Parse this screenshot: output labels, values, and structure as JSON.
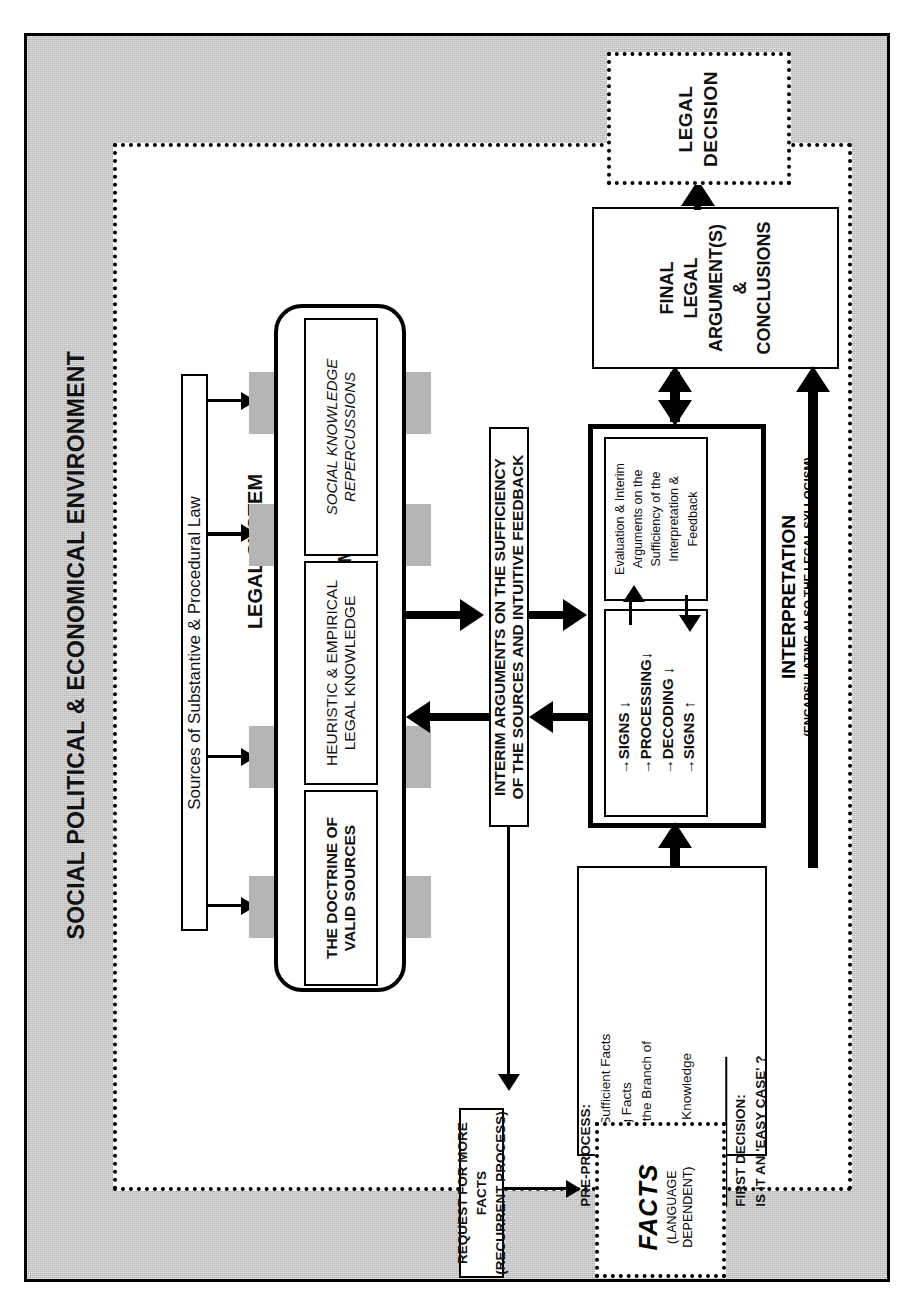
{
  "environment": {
    "title": "SOCIAL POLITICAL & ECONOMICAL ENVIRONMENT",
    "fill_color": "#c9c9c9"
  },
  "legal_system": {
    "label": "LEGAL SYSTEM"
  },
  "sources_box": {
    "label": "Sources of Substantive & Procedural Law"
  },
  "subsystem": {
    "label": "LEGAL SUBSYSTEM",
    "items": [
      {
        "label": "THE DOCTRINE OF\nVALID SOURCES"
      },
      {
        "label": "HEURISTIC & EMPIRICAL\nLEGAL KNOWLEDGE"
      },
      {
        "label": "SOCIAL KNOWLEDGE\nREPERCUSSIONS"
      }
    ],
    "tab_color": "#b5b5b5"
  },
  "interim_box": {
    "label": "INTERIM ARGUMENTS ON THE SUFFICIENCY\nOF THE SOURCES AND INTUITIVE FEEDBACK"
  },
  "interpretation": {
    "title": "INTERPRETATION",
    "subtitle": "(ENCAPSULATING ALSO THE LEGAL SYLLOGISM)",
    "evaluation_box": "Evaluation & Interim\nArguments on the\nSufficiency of the\nInterpretation &\nFeedback",
    "signs_box": "→SIGNS  ↓\n→PROCESSING↓\n→DECODING  ↓\n→SIGNS  ↑"
  },
  "preprocess": {
    "heading": "PRE-PROCESS:",
    "items": [
      "1.Relevant & Sufficient Facts",
      "2.Disqualifying Facts",
      "3.Selection of the Branch of",
      "Law",
      "4.Background Knowledge"
    ],
    "arrow_glyph": "→",
    "decision_heading": "FIRST DECISION:",
    "decision_question": "IS IT AN 'EASY CASE' ?"
  },
  "final_argument": {
    "label": "FINAL\nLEGAL\nARGUMENT(S)\n&\nCONCLUSIONS"
  },
  "legal_decision": {
    "label": "LEGAL\nDECISION"
  },
  "request_facts": {
    "label": "REQUEST FOR MORE\nFACTS\n(RECURRENT PROCESS)"
  },
  "facts": {
    "title": "FACTS",
    "subtitle": "(LANGUAGE\nDEPENDENT)"
  }
}
